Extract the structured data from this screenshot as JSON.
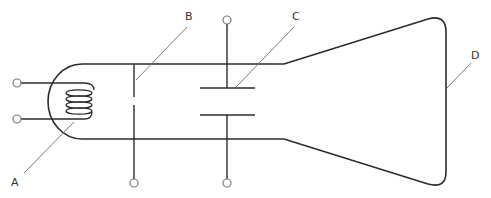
{
  "diagram": {
    "labels": {
      "A": "A",
      "B": "B",
      "C": "C",
      "D": "D"
    },
    "colors": {
      "stroke": "#2b2b2b",
      "leader": "#6b6b6b",
      "terminal_stroke": "#7a7a7a",
      "background": "#ffffff"
    }
  }
}
